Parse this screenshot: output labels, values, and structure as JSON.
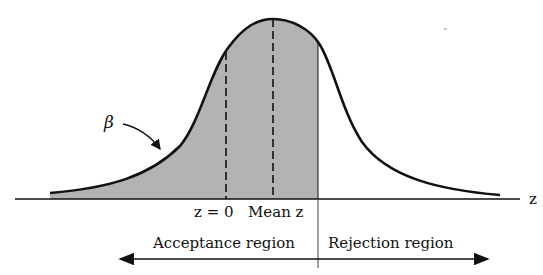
{
  "figure": {
    "type": "normal-distribution-diagram",
    "axis_label": "z",
    "greek_label": "β",
    "markers": [
      {
        "id": "z0",
        "label": "z = 0",
        "style": "dashed"
      },
      {
        "id": "mean",
        "label": "Mean z",
        "style": "dashed"
      },
      {
        "id": "boundary",
        "label": "",
        "style": "solid"
      }
    ],
    "regions": {
      "acceptance": "Acceptance region",
      "rejection": "Rejection region"
    },
    "colors": {
      "line": "#111111",
      "shade": "#b3b3b3",
      "background": "#ffffff"
    }
  }
}
